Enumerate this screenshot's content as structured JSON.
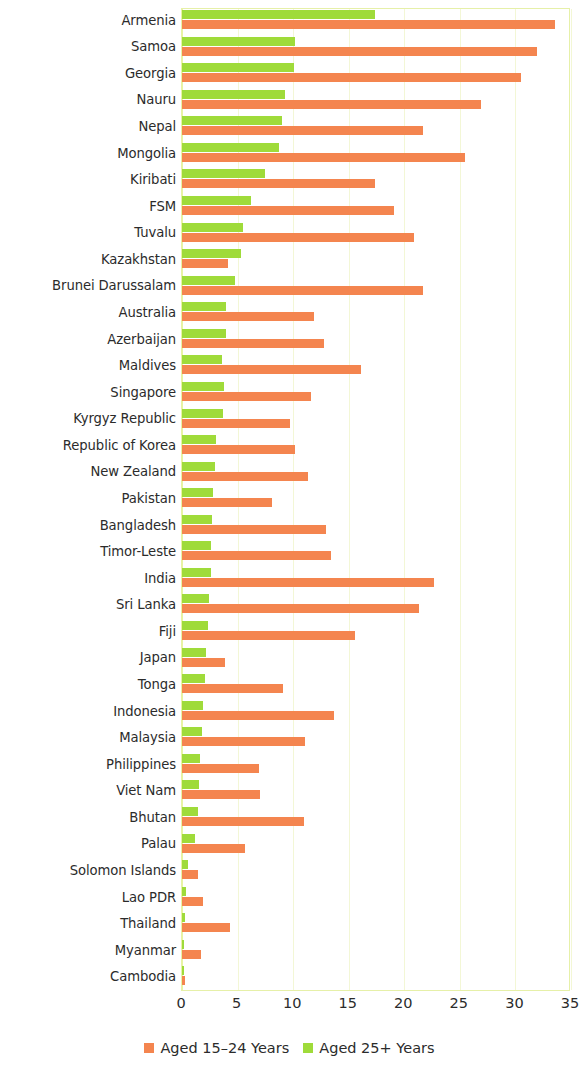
{
  "chart_data": {
    "type": "bar",
    "orientation": "horizontal",
    "grouped": true,
    "title": "",
    "subtitle": "",
    "xlabel": "",
    "ylabel": "",
    "xlim": [
      0,
      35
    ],
    "xticks": [
      0,
      5,
      10,
      15,
      20,
      25,
      30,
      35
    ],
    "xtick_labels": [
      "0",
      "5",
      "10",
      "15",
      "20",
      "25",
      "30",
      "35"
    ],
    "grid": true,
    "grid_axis": "x",
    "legend_position": "bottom-center",
    "legend": [
      {
        "label": "Aged 15–24 Years",
        "color": "#f4854f"
      },
      {
        "label": "Aged 25+ Years",
        "color": "#9fdb3a"
      }
    ],
    "categories": [
      "Armenia",
      "Samoa",
      "Georgia",
      "Nauru",
      "Nepal",
      "Mongolia",
      "Kiribati",
      "FSM",
      "Tuvalu",
      "Kazakhstan",
      "Brunei Darussalam",
      "Australia",
      "Azerbaijan",
      "Maldives",
      "Singapore",
      "Kyrgyz Republic",
      "Republic of Korea",
      "New Zealand",
      "Pakistan",
      "Bangladesh",
      "Timor-Leste",
      "India",
      "Sri Lanka",
      "Fiji",
      "Japan",
      "Tonga",
      "Indonesia",
      "Malaysia",
      "Philippines",
      "Viet Nam",
      "Bhutan",
      "Palau",
      "Solomon Islands",
      "Lao PDR",
      "Thailand",
      "Myanmar",
      "Cambodia"
    ],
    "series": [
      {
        "name": "Aged 15–24 Years",
        "color": "#f4854f",
        "values": [
          33.6,
          31.9,
          30.5,
          26.9,
          21.7,
          25.5,
          17.4,
          19.1,
          20.9,
          4.1,
          21.7,
          11.9,
          12.8,
          16.1,
          11.6,
          9.7,
          10.2,
          11.3,
          8.1,
          13.0,
          13.4,
          22.7,
          21.3,
          15.6,
          3.9,
          9.1,
          13.7,
          11.1,
          6.9,
          7.0,
          11.0,
          5.7,
          1.4,
          1.9,
          4.3,
          1.7,
          0.3
        ]
      },
      {
        "name": "Aged 25+ Years",
        "color": "#9fdb3a",
        "values": [
          17.4,
          10.2,
          10.1,
          9.3,
          9.0,
          8.7,
          7.5,
          6.2,
          5.5,
          5.3,
          4.8,
          4.0,
          4.0,
          3.6,
          3.8,
          3.7,
          3.1,
          3.0,
          2.8,
          2.7,
          2.6,
          2.6,
          2.4,
          2.3,
          2.2,
          2.1,
          1.9,
          1.8,
          1.6,
          1.5,
          1.4,
          1.2,
          0.5,
          0.4,
          0.3,
          0.2,
          0.1
        ]
      }
    ]
  }
}
